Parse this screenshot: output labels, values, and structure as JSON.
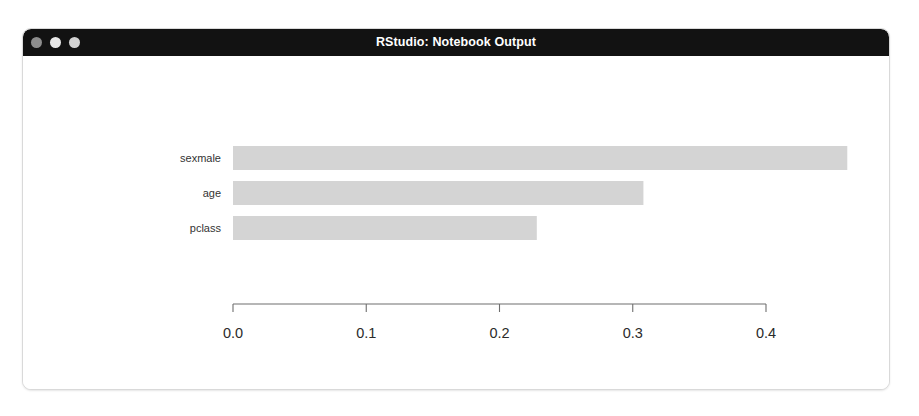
{
  "window": {
    "title": "RStudio: Notebook Output",
    "controls": [
      {
        "name": "close",
        "label": "Close"
      },
      {
        "name": "minimize",
        "label": "Minimize"
      },
      {
        "name": "zoom",
        "label": "Zoom"
      }
    ]
  },
  "colors": {
    "titlebar_bg": "#121212",
    "titlebar_text": "#ffffff",
    "window_bg": "#ffffff",
    "window_border": "#d9d9d9",
    "bar_fill": "#d4d4d4",
    "axis_line": "#6e6e6e",
    "label_text": "#333333"
  },
  "chart_data": {
    "type": "bar",
    "orientation": "horizontal",
    "title": "",
    "xlabel": "",
    "ylabel": "",
    "categories": [
      "sexmale",
      "age",
      "pclass"
    ],
    "values": [
      0.461,
      0.308,
      0.228
    ],
    "xlim": [
      0.0,
      0.4
    ],
    "xticks": [
      0.0,
      0.1,
      0.2,
      0.3,
      0.4
    ],
    "xticklabels": [
      "0.0",
      "0.1",
      "0.2",
      "0.3",
      "0.4"
    ],
    "grid": false,
    "legend": false,
    "bar_color": "#d4d4d4"
  }
}
